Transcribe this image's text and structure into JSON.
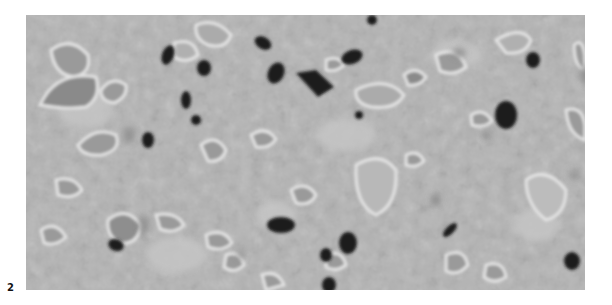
{
  "figure": {
    "panel_label": "2",
    "image_description": "Grayscale micrograph texture with dark particles and bright-rimmed irregular inclusions",
    "colors": {
      "background": "#b3b3b3",
      "dark_particles": "#1e1e1e",
      "bright_rims": "#e2e2e2",
      "mid_inclusions": "#8a8a8a"
    }
  }
}
